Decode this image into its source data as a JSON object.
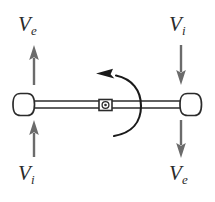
{
  "figure": {
    "background_color": "#ffffff",
    "stroke_color": "#2b2b2b",
    "arrow_color": "#6b6b6b",
    "width": 215,
    "height": 202
  },
  "labels": {
    "top_left": {
      "symbol": "V",
      "subscript": "e",
      "text": "Ve"
    },
    "top_right": {
      "symbol": "V",
      "subscript": "i",
      "text": "Vi"
    },
    "bottom_left": {
      "symbol": "V",
      "subscript": "i",
      "text": "Vi"
    },
    "bottom_right": {
      "symbol": "V",
      "subscript": "e",
      "text": "Ve"
    }
  },
  "arrows": [
    {
      "name": "top-left-arrow",
      "direction": "up",
      "label": "Ve"
    },
    {
      "name": "top-right-arrow",
      "direction": "down",
      "label": "Vi"
    },
    {
      "name": "bottom-left-arrow",
      "direction": "up",
      "label": "Vi"
    },
    {
      "name": "bottom-right-arrow",
      "direction": "down",
      "label": "Ve"
    }
  ],
  "rod": {
    "name": "horizontal-rod",
    "end_caps": [
      "left-end-cap",
      "right-end-cap"
    ],
    "pivot": "center-pivot-marker"
  },
  "rotation": {
    "name": "rotation-arrow",
    "direction": "counterclockwise"
  }
}
